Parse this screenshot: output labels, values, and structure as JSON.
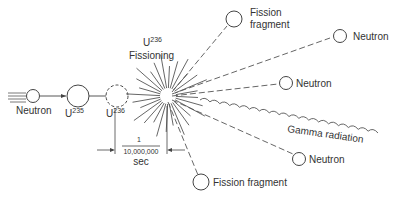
{
  "diagram": {
    "labels": {
      "neutron_in": "Neutron",
      "u235": "U",
      "u235_sup": "235",
      "u236": "U",
      "u236_sup": "236",
      "fissioning_u": "U",
      "fissioning_sup": "236",
      "fissioning": "Fissioning",
      "fragment_top_line1": "Fission",
      "fragment_top_line2": "fragment",
      "neutron_1": "Neutron",
      "neutron_2": "Neutron",
      "gamma": "Gamma radiation",
      "neutron_3": "Neutron",
      "fragment_bottom": "Fission fragment",
      "time_numerator": "1",
      "time_denominator": "10,000,000",
      "time_unit": "sec"
    },
    "colors": {
      "stroke": "#444444",
      "text": "#333333"
    }
  }
}
